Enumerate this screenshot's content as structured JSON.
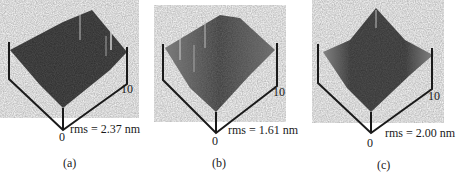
{
  "figure": {
    "panels": [
      {
        "id": "a",
        "caption": "(a)",
        "rms": "rms = 2.37 nm",
        "axis_max": "10",
        "axis_origin": "0",
        "tone": "dark"
      },
      {
        "id": "b",
        "caption": "(b)",
        "rms": "rms = 1.61 nm",
        "axis_max": "10",
        "axis_origin": "0",
        "tone": "mixed"
      },
      {
        "id": "c",
        "caption": "(c)",
        "rms": "rms = 2.00 nm",
        "axis_max": "10",
        "axis_origin": "0",
        "tone": "dark-center"
      }
    ]
  },
  "colors": {
    "ink": "#1a1a1a",
    "surface_dark": "#2b2b2b",
    "surface_mid": "#555555",
    "surface_light": "#8a8a8a"
  }
}
